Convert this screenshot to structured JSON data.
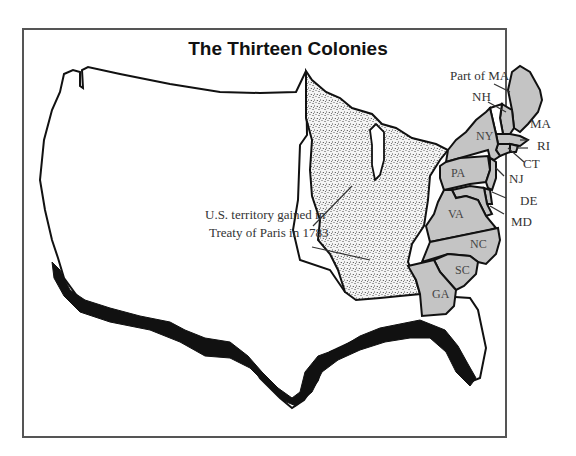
{
  "title": "The Thirteen Colonies",
  "annotation": {
    "line1": "U.S. territory gained in",
    "line2": "Treaty of Paris in 1783"
  },
  "colonies": [
    {
      "abbr": "Part of MA",
      "name": "Maine (part of Massachusetts)"
    },
    {
      "abbr": "NH",
      "name": "New Hampshire"
    },
    {
      "abbr": "MA",
      "name": "Massachusetts"
    },
    {
      "abbr": "RI",
      "name": "Rhode Island"
    },
    {
      "abbr": "CT",
      "name": "Connecticut"
    },
    {
      "abbr": "NY",
      "name": "New York"
    },
    {
      "abbr": "NJ",
      "name": "New Jersey"
    },
    {
      "abbr": "PA",
      "name": "Pennsylvania"
    },
    {
      "abbr": "DE",
      "name": "Delaware"
    },
    {
      "abbr": "MD",
      "name": "Maryland"
    },
    {
      "abbr": "VA",
      "name": "Virginia"
    },
    {
      "abbr": "NC",
      "name": "North Carolina"
    },
    {
      "abbr": "SC",
      "name": "South Carolina"
    },
    {
      "abbr": "GA",
      "name": "Georgia"
    }
  ],
  "colors": {
    "colonies_fill": "#c4c4c4",
    "territory_fill": "#f2f2f2",
    "outline": "#111111",
    "spanish_border": "#111111",
    "frame": "#555555"
  }
}
